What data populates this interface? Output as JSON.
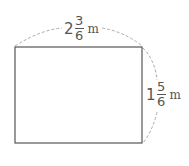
{
  "diagram": {
    "shape": "rectangle",
    "width_label": {
      "whole": "2",
      "numerator": "3",
      "denominator": "6",
      "unit": "m"
    },
    "height_label": {
      "whole": "1",
      "numerator": "5",
      "denominator": "6",
      "unit": "m"
    },
    "colors": {
      "outline": "#555555",
      "dashed": "#aaaaaa",
      "text": "#555555"
    }
  }
}
